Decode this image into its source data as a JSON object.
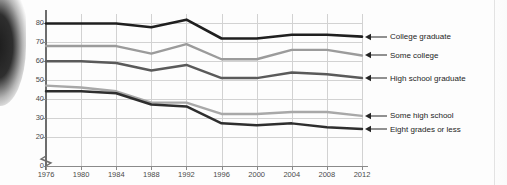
{
  "chart_data": {
    "type": "line",
    "title": "",
    "xlabel": "",
    "ylabel": "",
    "x": [
      1976,
      1980,
      1984,
      1988,
      1992,
      1996,
      2000,
      2004,
      2008,
      2012
    ],
    "categories": [
      "1976",
      "1980",
      "1984",
      "1988",
      "1992",
      "1996",
      "2000",
      "2004",
      "2008",
      "2012"
    ],
    "xlim": [
      1976,
      2012
    ],
    "ylim": [
      15,
      85
    ],
    "y_ticks": [
      "0",
      "20",
      "30",
      "40",
      "50",
      "60",
      "70",
      "80"
    ],
    "y_axis_break": true,
    "grid": true,
    "legend_position": "right-arrow-annotations",
    "series": [
      {
        "name": "College graduate",
        "color": "#1f1f1f",
        "width": 2.6,
        "values": [
          80,
          80,
          80,
          78,
          82,
          72,
          72,
          74,
          74,
          73
        ]
      },
      {
        "name": "Some college",
        "color": "#9b9b9b",
        "width": 2.4,
        "values": [
          68,
          68,
          68,
          64,
          69,
          61,
          61,
          66,
          66,
          63
        ]
      },
      {
        "name": "High school graduate",
        "color": "#5a5a5a",
        "width": 2.5,
        "values": [
          60,
          60,
          59,
          55,
          58,
          51,
          51,
          54,
          53,
          51
        ]
      },
      {
        "name": "Some high school",
        "color": "#a8a8a8",
        "width": 2.4,
        "values": [
          47,
          46,
          44,
          38,
          38,
          32,
          32,
          33,
          33,
          31
        ]
      },
      {
        "name": "Eight grades or less",
        "color": "#2e2e2e",
        "width": 2.5,
        "values": [
          44,
          44,
          43,
          37,
          36,
          27,
          26,
          27,
          25,
          24
        ]
      }
    ],
    "annotations": [
      {
        "label": "College graduate",
        "value": 73
      },
      {
        "label": "Some college",
        "value": 63
      },
      {
        "label": "High school graduate",
        "value": 51
      },
      {
        "label": "Some high school",
        "value": 31
      },
      {
        "label": "Eight grades or less",
        "value": 24
      }
    ]
  }
}
